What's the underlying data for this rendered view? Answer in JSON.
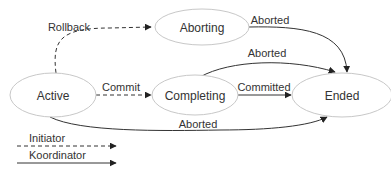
{
  "diagram": {
    "type": "state-transition",
    "nodes": {
      "active": {
        "label": "Active"
      },
      "aborting": {
        "label": "Aborting"
      },
      "completing": {
        "label": "Completing"
      },
      "ended": {
        "label": "Ended"
      }
    },
    "edges": {
      "rollback": {
        "label": "Rollback",
        "from": "Active",
        "to": "Aborting",
        "style": "dashed"
      },
      "commit": {
        "label": "Commit",
        "from": "Active",
        "to": "Completing",
        "style": "dashed"
      },
      "committed": {
        "label": "Committed",
        "from": "Completing",
        "to": "Ended",
        "style": "solid"
      },
      "aborted_from_aborting": {
        "label": "Aborted",
        "from": "Aborting",
        "to": "Ended",
        "style": "solid"
      },
      "aborted_from_completing": {
        "label": "Aborted",
        "from": "Completing",
        "to": "Ended",
        "style": "solid"
      },
      "aborted_from_active": {
        "label": "Aborted",
        "from": "Active",
        "to": "Ended",
        "style": "solid"
      }
    },
    "legend": {
      "initiator": {
        "label": "Initiator",
        "style": "dashed"
      },
      "koordinator": {
        "label": "Koordinator",
        "style": "solid"
      }
    },
    "colors": {
      "line": "#333333",
      "node_border": "#c8c8c8",
      "text": "#333333",
      "background": "#ffffff"
    }
  }
}
